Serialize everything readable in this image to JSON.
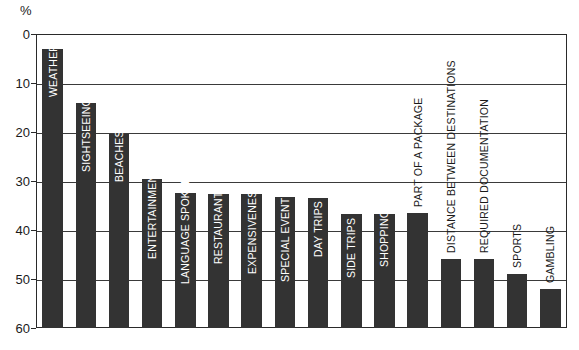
{
  "axis": {
    "unit_label": "%",
    "y_ticks": [
      "60",
      "50",
      "40",
      "30",
      "20",
      "10",
      "0"
    ]
  },
  "chart_data": {
    "type": "bar",
    "title": "",
    "subtitle": "",
    "xlabel": "",
    "ylabel": "%",
    "ylim": [
      0,
      60
    ],
    "yticks": [
      0,
      10,
      20,
      30,
      40,
      50,
      60
    ],
    "grid": true,
    "legend": false,
    "orientation": "vertical",
    "bar_color": "#333333",
    "categories": [
      "WEATHER",
      "SIGHTSEEING",
      "BEACHES",
      "ENTERTAINMENT",
      "LANGUAGE SPOKEN",
      "RESTAURANTS",
      "EXPENSIVENESS",
      "SPECIAL EVENTS",
      "DAY TRIPS",
      "SIDE TRIPS",
      "SHOPPING",
      "PART OF A PACKAGE",
      "DISTANCE BETWEEN DESTINATIONS",
      "REQUIRED DOCUMENTATION",
      "SPORTS",
      "GAMBLING"
    ],
    "values": [
      57,
      46,
      39.5,
      30.5,
      27.5,
      27.3,
      27.3,
      26.8,
      26.5,
      23.3,
      23.3,
      23.5,
      14,
      14,
      11,
      8
    ],
    "label_placement": [
      "inside",
      "inside",
      "inside",
      "inside",
      "inside",
      "inside",
      "inside",
      "inside",
      "inside",
      "inside",
      "inside",
      "outside",
      "outside",
      "outside",
      "outside",
      "outside"
    ]
  }
}
